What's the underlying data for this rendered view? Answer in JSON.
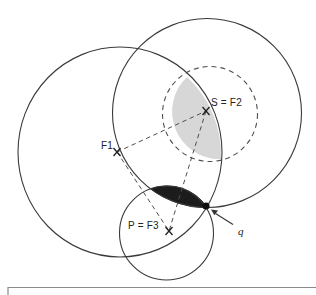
{
  "figure": {
    "type": "geometry-diagram",
    "background": "#ffffff",
    "colors": {
      "circle_stroke": "#3a3a3a",
      "dashed_stroke": "#4f4f4f",
      "gray_region_fill": "#d7d7d7",
      "dark_region_fill": "#1c1c1c",
      "dot_fill": "#111111",
      "frame_stroke": "#8a8a8a",
      "label_color": "#222222"
    },
    "points": {
      "F1": {
        "label": "F1",
        "x": 117,
        "y": 152,
        "marker": "x-cross"
      },
      "S": {
        "label": "S = F2",
        "x": 206,
        "y": 111,
        "marker": "x-cross"
      },
      "P": {
        "label": "P = F3",
        "x": 169,
        "y": 231,
        "marker": "x-cross"
      },
      "q": {
        "label": "q",
        "x": 206,
        "y": 206,
        "marker": "filled-dot"
      }
    },
    "circles": [
      {
        "name": "left-circle",
        "cx": 120,
        "cy": 152,
        "rx": 102,
        "ry": 105,
        "style": "solid"
      },
      {
        "name": "right-circle",
        "cx": 207,
        "cy": 113,
        "rx": 94.5,
        "ry": 94.5,
        "style": "solid"
      },
      {
        "name": "small-circle",
        "cx": 166.5,
        "cy": 233,
        "rx": 47,
        "ry": 47,
        "style": "solid"
      },
      {
        "name": "range-circle",
        "cx": 210,
        "cy": 114,
        "rx": 47.5,
        "ry": 47.5,
        "style": "dashed"
      }
    ],
    "dashed_segments": [
      {
        "from": "F1",
        "to": "S"
      },
      {
        "from": "S",
        "to": "P"
      },
      {
        "from": "F1",
        "to": "P"
      }
    ],
    "regions": [
      {
        "name": "gray-intersection-region",
        "between": [
          "range-circle",
          "left-circle"
        ],
        "fill": "#d7d7d7"
      },
      {
        "name": "dark-intersection-region",
        "between": [
          "right-circle",
          "small-circle"
        ],
        "fill": "#1c1c1c"
      }
    ],
    "arrow": {
      "points_to": "q",
      "tail": [
        233,
        224.5
      ],
      "head": [
        212,
        211
      ]
    },
    "frame": {
      "corner_x": 8,
      "top_y": 287.5,
      "note": "top-left corner of a box clipped at bottom edge"
    }
  }
}
